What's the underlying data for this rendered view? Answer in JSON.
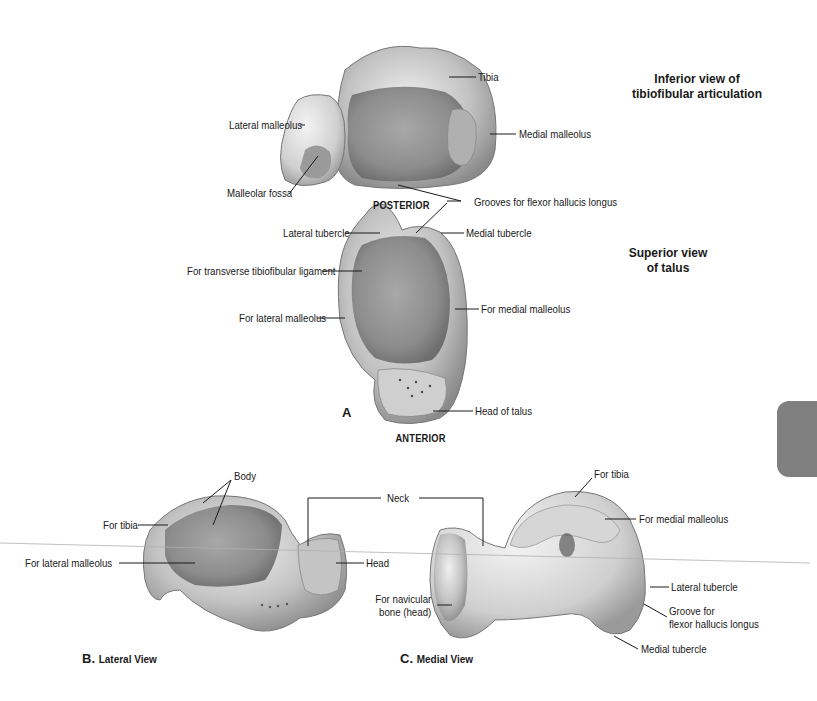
{
  "figure_a": {
    "letter": "A",
    "inferior_caption_line1": "Inferior view of",
    "inferior_caption_line2": "tibiofibular articulation",
    "superior_caption_line1": "Superior view",
    "superior_caption_line2": "of talus",
    "posterior": "POSTERIOR",
    "anterior": "ANTERIOR",
    "labels": {
      "tibia": "Tibia",
      "lateral_malleolus": "Lateral malleolus",
      "medial_malleolus": "Medial malleolus",
      "malleolar_fossa": "Malleolar fossa",
      "grooves_fhl": "Grooves for flexor hallucis longus",
      "lateral_tubercle": "Lateral tubercle",
      "medial_tubercle": "Medial tubercle",
      "transverse_lig": "For transverse tibiofibular ligament",
      "for_lateral_malleolus": "For lateral malleolus",
      "for_medial_malleolus": "For medial malleolus",
      "head_of_talus": "Head of talus"
    }
  },
  "figure_b": {
    "letter": "B.",
    "title": "Lateral View",
    "labels": {
      "body": "Body",
      "for_tibia": "For tibia",
      "for_lateral_malleolus": "For lateral malleolus",
      "head": "Head"
    }
  },
  "shared": {
    "neck": "Neck"
  },
  "figure_c": {
    "letter": "C.",
    "title": "Medial View",
    "labels": {
      "for_tibia": "For tibia",
      "for_medial_malleolus": "For medial malleolus",
      "lateral_tubercle": "Lateral tubercle",
      "groove_line1": "Groove for",
      "groove_line2": "flexor hallucis longus",
      "for_navicular_line1": "For navicular",
      "for_navicular_line2": "bone (head)",
      "medial_tubercle": "Medial tubercle"
    }
  },
  "colors": {
    "bone_light": "#e6e6e6",
    "bone_mid": "#b4b4b4",
    "bone_dark": "#7a7a7a",
    "leader": "#1a1a1a",
    "side_tab": "#808080"
  }
}
